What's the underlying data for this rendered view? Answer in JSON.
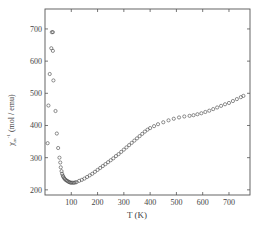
{
  "chart_data": {
    "type": "scatter",
    "title": "",
    "xlabel": "T (K)",
    "ylabel": "χ_m^-1 (mol / emu)",
    "ylabel_main": "χ",
    "ylabel_sub": "m",
    "ylabel_sup": "-1",
    "ylabel_units": "(mol / emu)",
    "xlim": [
      0,
      780
    ],
    "ylim": [
      184,
      762
    ],
    "xticks": [
      100,
      200,
      300,
      400,
      500,
      600,
      700
    ],
    "yticks": [
      200,
      300,
      400,
      500,
      600,
      700
    ],
    "grid": false,
    "legend": null,
    "marker": "open-circle",
    "series": [
      {
        "name": "data",
        "points": [
          [
            10,
            345
          ],
          [
            13,
            462
          ],
          [
            18,
            560
          ],
          [
            26,
            690
          ],
          [
            30,
            690
          ],
          [
            24,
            640
          ],
          [
            30,
            632
          ],
          [
            32,
            540
          ],
          [
            40,
            445
          ],
          [
            45,
            375
          ],
          [
            50,
            330
          ],
          [
            55,
            300
          ],
          [
            58,
            285
          ],
          [
            60,
            270
          ],
          [
            63,
            258
          ],
          [
            65,
            250
          ],
          [
            68,
            244
          ],
          [
            70,
            240
          ],
          [
            73,
            236
          ],
          [
            76,
            233
          ],
          [
            80,
            230
          ],
          [
            84,
            228
          ],
          [
            88,
            226
          ],
          [
            92,
            224
          ],
          [
            96,
            223
          ],
          [
            100,
            222
          ],
          [
            105,
            222
          ],
          [
            110,
            222
          ],
          [
            115,
            223
          ],
          [
            120,
            224
          ],
          [
            130,
            228
          ],
          [
            140,
            231
          ],
          [
            150,
            235
          ],
          [
            160,
            240
          ],
          [
            170,
            245
          ],
          [
            180,
            250
          ],
          [
            190,
            256
          ],
          [
            200,
            262
          ],
          [
            210,
            268
          ],
          [
            220,
            274
          ],
          [
            230,
            280
          ],
          [
            240,
            286
          ],
          [
            250,
            292
          ],
          [
            260,
            298
          ],
          [
            270,
            305
          ],
          [
            280,
            311
          ],
          [
            290,
            318
          ],
          [
            300,
            325
          ],
          [
            310,
            332
          ],
          [
            320,
            339
          ],
          [
            330,
            346
          ],
          [
            340,
            353
          ],
          [
            350,
            360
          ],
          [
            360,
            367
          ],
          [
            370,
            374
          ],
          [
            380,
            381
          ],
          [
            390,
            387
          ],
          [
            400,
            392
          ],
          [
            415,
            398
          ],
          [
            430,
            404
          ],
          [
            450,
            410
          ],
          [
            470,
            416
          ],
          [
            490,
            421
          ],
          [
            510,
            425
          ],
          [
            530,
            428
          ],
          [
            550,
            430
          ],
          [
            565,
            432
          ],
          [
            580,
            435
          ],
          [
            595,
            438
          ],
          [
            610,
            442
          ],
          [
            625,
            446
          ],
          [
            640,
            451
          ],
          [
            655,
            456
          ],
          [
            670,
            461
          ],
          [
            685,
            466
          ],
          [
            700,
            470
          ],
          [
            715,
            476
          ],
          [
            730,
            482
          ],
          [
            745,
            488
          ],
          [
            755,
            492
          ]
        ]
      }
    ]
  }
}
